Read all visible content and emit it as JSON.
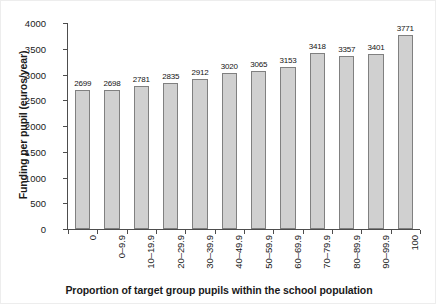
{
  "chart_data": {
    "type": "bar",
    "title": "",
    "xlabel": "Proportion of target group pupils within the school population",
    "ylabel": "Funding per pupil (euros/year)",
    "categories": [
      "0",
      "0–9.9",
      "10–19.9",
      "20–29.9",
      "30–39.9",
      "40–49.9",
      "50–59.9",
      "60–69.9",
      "70–79.9",
      "80–89.9",
      "90–99.9",
      "100"
    ],
    "values": [
      2699,
      2698,
      2781,
      2835,
      2912,
      3020,
      3065,
      3153,
      3418,
      3357,
      3401,
      3771
    ],
    "data_labels": [
      "2699",
      "2698",
      "2781",
      "2835",
      "2912",
      "3020",
      "3065",
      "3153",
      "3418",
      "3357",
      "3401",
      "3771"
    ],
    "ylim": [
      0,
      4000
    ],
    "yticks": [
      0,
      500,
      1000,
      1500,
      2000,
      2500,
      3000,
      3500,
      4000
    ],
    "ytick_labels": [
      "0",
      "500",
      "1000",
      "1500",
      "2000",
      "2500",
      "3000",
      "3500",
      "4000"
    ],
    "grid": false,
    "legend": null,
    "bar_color": "#d0d0d0",
    "bar_edge_color": "#808080",
    "axis_color": "#4d4d4d",
    "text_color": "#1a1a1a",
    "background": "#ffffff"
  }
}
